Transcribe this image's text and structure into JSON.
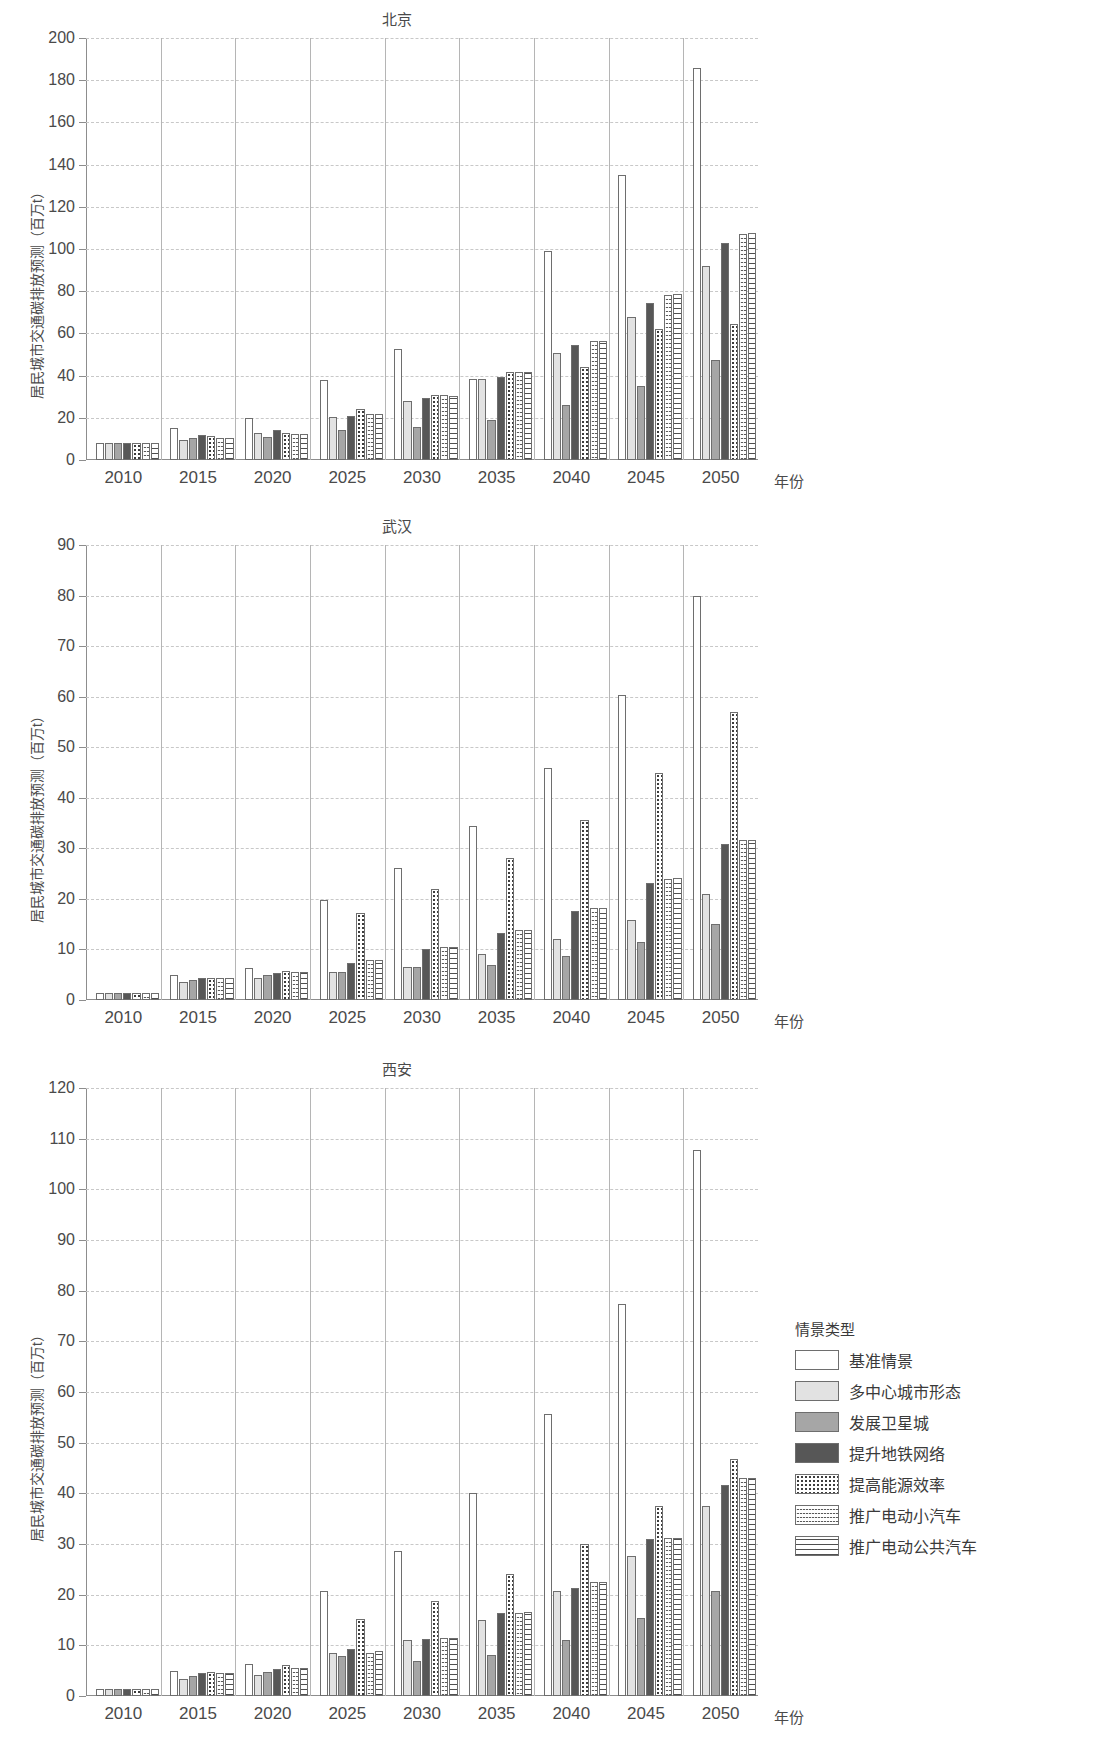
{
  "figure": {
    "yaxis_label": "居民城市交通碳排放预测（百万t）",
    "xaxis_label": "年份",
    "categories": [
      "2010",
      "2015",
      "2020",
      "2025",
      "2030",
      "2035",
      "2040",
      "2045",
      "2050"
    ]
  },
  "legend": {
    "title": "情景类型",
    "items": [
      {
        "label": "基准情景",
        "pattern": "solid-white",
        "color": "#ffffff"
      },
      {
        "label": "多中心城市形态",
        "pattern": "solid-light-gray",
        "color": "#e2e2e2"
      },
      {
        "label": "发展卫星城",
        "pattern": "solid-mid-gray",
        "color": "#a6a6a6"
      },
      {
        "label": "提升地铁网络",
        "pattern": "solid-dark-gray",
        "color": "#575757"
      },
      {
        "label": "提高能源效率",
        "pattern": "dotted",
        "color": "#ffffff"
      },
      {
        "label": "推广电动小汽车",
        "pattern": "wavy-lines",
        "color": "#ffffff"
      },
      {
        "label": "推广电动公共汽车",
        "pattern": "horizontal-lines",
        "color": "#ffffff"
      }
    ]
  },
  "chart_data": [
    {
      "type": "bar",
      "title": "北京",
      "xlabel": "年份",
      "ylabel": "居民城市交通碳排放预测（百万t）",
      "ylim": [
        0,
        200
      ],
      "yticks": [
        0,
        20,
        40,
        60,
        80,
        100,
        120,
        140,
        160,
        180,
        200
      ],
      "grid": true,
      "legend_position": "right",
      "categories": [
        "2010",
        "2015",
        "2020",
        "2025",
        "2030",
        "2035",
        "2040",
        "2045",
        "2050"
      ],
      "series": [
        {
          "name": "基准情景",
          "values": [
            8,
            15,
            20,
            38,
            52.5,
            38.5,
            99,
            135,
            186
          ]
        },
        {
          "name": "多中心城市形态",
          "values": [
            8,
            9.5,
            13,
            20.5,
            28,
            38.5,
            50.5,
            68,
            92
          ]
        },
        {
          "name": "发展卫星城",
          "values": [
            8,
            10.5,
            11,
            14,
            15.5,
            19,
            26,
            35,
            47.5
          ]
        },
        {
          "name": "提升地铁网络",
          "values": [
            8,
            12,
            14,
            21,
            29.5,
            39.5,
            54.5,
            74.5,
            103
          ]
        },
        {
          "name": "提高能源效率",
          "values": [
            8,
            11.5,
            13,
            24,
            31,
            41.5,
            44,
            62,
            64.5
          ]
        },
        {
          "name": "推广电动小汽车",
          "values": [
            8,
            10.5,
            12.5,
            22,
            31,
            41.5,
            56.5,
            78,
            107
          ]
        },
        {
          "name": "推广电动公共汽车",
          "values": [
            8,
            10.5,
            12.5,
            22,
            30.5,
            41.5,
            56.5,
            78.5,
            107.5
          ]
        }
      ]
    },
    {
      "type": "bar",
      "title": "武汉",
      "xlabel": "年份",
      "ylabel": "居民城市交通碳排放预测（百万t）",
      "ylim": [
        0,
        90
      ],
      "yticks": [
        0,
        10,
        20,
        30,
        40,
        50,
        60,
        70,
        80,
        90
      ],
      "grid": true,
      "legend_position": "right",
      "categories": [
        "2010",
        "2015",
        "2020",
        "2025",
        "2030",
        "2035",
        "2040",
        "2045",
        "2050"
      ],
      "series": [
        {
          "name": "基准情景",
          "values": [
            1.4,
            4.9,
            6.4,
            19.7,
            26.1,
            34.4,
            45.8,
            60.3,
            80.0
          ]
        },
        {
          "name": "多中心城市形态",
          "values": [
            1.4,
            3.6,
            4.4,
            5.6,
            6.6,
            9.2,
            12.0,
            15.8,
            21.0
          ]
        },
        {
          "name": "发展卫星城",
          "values": [
            1.4,
            3.9,
            5.0,
            5.6,
            6.5,
            7.0,
            8.8,
            11.4,
            15.1
          ]
        },
        {
          "name": "提升地铁网络",
          "values": [
            1.4,
            4.3,
            5.4,
            7.3,
            10.0,
            13.3,
            17.6,
            23.2,
            30.8
          ]
        },
        {
          "name": "提高能源效率",
          "values": [
            1.4,
            4.4,
            5.8,
            17.2,
            22.0,
            28.0,
            35.6,
            45.0,
            57.0
          ]
        },
        {
          "name": "推广电动小汽车",
          "values": [
            1.4,
            4.3,
            5.6,
            7.9,
            10.4,
            13.8,
            18.2,
            24.0,
            31.7
          ]
        },
        {
          "name": "推广电动公共汽车",
          "values": [
            1.4,
            4.3,
            5.6,
            7.9,
            10.4,
            13.8,
            18.2,
            24.1,
            31.7
          ]
        }
      ]
    },
    {
      "type": "bar",
      "title": "西安",
      "xlabel": "年份",
      "ylabel": "居民城市交通碳排放预测（百万t）",
      "ylim": [
        0,
        120
      ],
      "yticks": [
        0,
        10,
        20,
        30,
        40,
        50,
        60,
        70,
        80,
        90,
        100,
        110,
        120
      ],
      "grid": true,
      "legend_position": "right",
      "categories": [
        "2010",
        "2015",
        "2020",
        "2025",
        "2030",
        "2035",
        "2040",
        "2045",
        "2050"
      ],
      "series": [
        {
          "name": "基准情景",
          "values": [
            1.4,
            5.0,
            6.4,
            20.7,
            28.6,
            40.0,
            55.7,
            77.3,
            107.7
          ]
        },
        {
          "name": "多中心城市形态",
          "values": [
            1.4,
            3.3,
            4.2,
            8.5,
            11.0,
            15.0,
            20.8,
            27.6,
            37.6
          ]
        },
        {
          "name": "发展卫星城",
          "values": [
            1.4,
            4.0,
            4.7,
            7.8,
            7.0,
            8.0,
            11.0,
            15.3,
            20.7
          ]
        },
        {
          "name": "提升地铁网络",
          "values": [
            1.4,
            4.5,
            5.4,
            9.2,
            11.2,
            16.4,
            21.3,
            30.9,
            41.6
          ]
        },
        {
          "name": "提高能源效率",
          "values": [
            1.4,
            4.8,
            6.2,
            15.2,
            18.8,
            24.0,
            30.0,
            37.6,
            46.7
          ]
        },
        {
          "name": "推广电动小汽车",
          "values": [
            1.4,
            4.5,
            5.6,
            8.4,
            11.5,
            16.4,
            22.5,
            31.1,
            43.0
          ]
        },
        {
          "name": "推广电动公共汽车",
          "values": [
            1.4,
            4.5,
            5.6,
            8.8,
            11.5,
            16.6,
            22.5,
            31.2,
            43.0
          ]
        }
      ]
    }
  ]
}
